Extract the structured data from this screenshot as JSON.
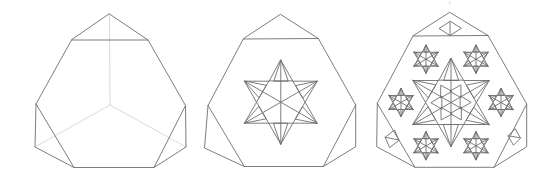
{
  "meta": {
    "description_name": "fractal-truncated-tetrahedron-iterations",
    "background_color": "#ffffff",
    "edge_color": "#6e6e6e",
    "hidden_edge_color": "#d6d6d6",
    "stroke_width": 0.9,
    "canvas": {
      "width": 555,
      "height": 186
    }
  },
  "figures": [
    {
      "name": "iteration-0-truncated-tetrahedron",
      "outline": [
        [
          109.5,
          14
        ],
        [
          148,
          40
        ],
        [
          185.5,
          105.5
        ],
        [
          186,
          147
        ],
        [
          154,
          167.5
        ],
        [
          74,
          167.5
        ],
        [
          35,
          147
        ],
        [
          36,
          104
        ],
        [
          71.5,
          40
        ]
      ],
      "edges": [
        [
          [
            71.5,
            40
          ],
          [
            148,
            40
          ]
        ],
        [
          [
            36,
            104
          ],
          [
            74,
            167.5
          ]
        ],
        [
          [
            185.5,
            105.5
          ],
          [
            154,
            167.5
          ]
        ]
      ],
      "hidden_edges": [
        [
          [
            109.5,
            14
          ],
          [
            110,
            105
          ]
        ],
        [
          [
            110,
            105
          ],
          [
            35,
            147
          ]
        ],
        [
          [
            110,
            105
          ],
          [
            186,
            147
          ]
        ]
      ],
      "stars": [],
      "diamonds": []
    },
    {
      "name": "iteration-1-single-star",
      "outline": [
        [
          280.7,
          14.5
        ],
        [
          318.3,
          38.5
        ],
        [
          355.7,
          105
        ],
        [
          355.7,
          146.7
        ],
        [
          323.3,
          166.5
        ],
        [
          244.3,
          166.5
        ],
        [
          204.5,
          148
        ],
        [
          208,
          105.5
        ],
        [
          243.3,
          39
        ]
      ],
      "edges": [
        [
          [
            243.3,
            39
          ],
          [
            318.3,
            38.5
          ]
        ],
        [
          [
            208,
            105.5
          ],
          [
            244.3,
            166.5
          ]
        ],
        [
          [
            355.7,
            105
          ],
          [
            323.3,
            166.5
          ]
        ]
      ],
      "hidden_edges": [],
      "stars": [
        {
          "name": "central-star",
          "cx": 280.8,
          "cy": 102.2,
          "r": 42,
          "hexagon": true,
          "diameters": true,
          "spikes": true,
          "core": false
        }
      ],
      "diamonds": []
    },
    {
      "name": "iteration-2-star-cluster",
      "outline": [
        [
          450,
          12.5
        ],
        [
          488,
          35.5
        ],
        [
          526.7,
          104
        ],
        [
          526.7,
          146.7
        ],
        [
          494,
          167.3
        ],
        [
          415,
          167.3
        ],
        [
          376.7,
          146.7
        ],
        [
          377.3,
          103.3
        ],
        [
          413,
          36
        ]
      ],
      "edges": [
        [
          [
            413,
            36
          ],
          [
            488,
            35.5
          ]
        ],
        [
          [
            377.3,
            103.3
          ],
          [
            415,
            167.3
          ]
        ],
        [
          [
            526.7,
            104
          ],
          [
            494,
            167.3
          ]
        ]
      ],
      "hidden_edges": [
        [
          [
            449.7,
            1.5
          ],
          [
            449.7,
            4
          ]
        ]
      ],
      "stars": [
        {
          "name": "central-star",
          "cx": 451,
          "cy": 102.5,
          "r": 44,
          "hexagon": true,
          "diameters": true,
          "spikes": true,
          "core": true
        },
        {
          "name": "satellite-star-right",
          "cx": 501,
          "cy": 102.5,
          "r": 14,
          "hexagon": true,
          "diameters": true,
          "spikes": true,
          "core": false
        },
        {
          "name": "satellite-star-top-right",
          "cx": 476,
          "cy": 59.2,
          "r": 14,
          "hexagon": true,
          "diameters": true,
          "spikes": true,
          "core": false
        },
        {
          "name": "satellite-star-top-left",
          "cx": 426,
          "cy": 59.2,
          "r": 14,
          "hexagon": true,
          "diameters": true,
          "spikes": true,
          "core": false
        },
        {
          "name": "satellite-star-left",
          "cx": 401,
          "cy": 102.5,
          "r": 14,
          "hexagon": true,
          "diameters": true,
          "spikes": true,
          "core": false
        },
        {
          "name": "satellite-star-bottom-left",
          "cx": 426,
          "cy": 145.8,
          "r": 14,
          "hexagon": true,
          "diameters": true,
          "spikes": true,
          "core": false
        },
        {
          "name": "satellite-star-bottom-right",
          "cx": 476,
          "cy": 145.8,
          "r": 14,
          "hexagon": true,
          "diameters": true,
          "spikes": true,
          "core": false
        }
      ],
      "diamonds": [
        {
          "name": "top-face-diamond",
          "cx": 450,
          "cy": 28.5,
          "a": [
            11,
            0
          ],
          "b": [
            0,
            7
          ],
          "diag": "b"
        },
        {
          "name": "bottom-left-face-diamond",
          "cx": 392,
          "cy": 138.6,
          "a": [
            6.85,
            1.35
          ],
          "b": [
            2.5,
            -8.65
          ],
          "diag": "a"
        },
        {
          "name": "bottom-right-face-diamond",
          "cx": 514.2,
          "cy": 136.8,
          "a": [
            6.15,
            1.0
          ],
          "b": [
            1.0,
            -8.1
          ],
          "diag": "a"
        }
      ]
    }
  ],
  "star_style": {
    "tip_angles_deg": [
      -90,
      -30,
      30,
      90,
      150,
      210
    ],
    "inner_angles_deg": [
      -60,
      0,
      60,
      120,
      180,
      240
    ],
    "inner_radius_factor": 0.57735,
    "spike_triangle_base_factor": 0.29,
    "core_apex_factor": 0.78,
    "core_base_factor": 0.36,
    "core_halfwidth_factor": 0.25
  }
}
